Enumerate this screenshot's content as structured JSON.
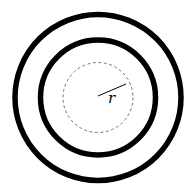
{
  "diagram": {
    "center": {
      "x": 98,
      "y": 98
    },
    "outer_circle": {
      "r": 83,
      "stroke": "#000000",
      "stroke_width": 5.5
    },
    "inner_circle": {
      "r": 57.5,
      "stroke": "#000000",
      "stroke_width": 5.5
    },
    "dashed_circle": {
      "r": 35,
      "stroke": "#666666",
      "stroke_width": 0.9,
      "dash": "3,2.5"
    },
    "radius_line": {
      "x1": 98,
      "y1": 96,
      "x2": 126,
      "y2": 84,
      "stroke": "#000000"
    },
    "radius_label": "r",
    "colors": {
      "background": "#ffffff",
      "ink": "#000000"
    }
  }
}
